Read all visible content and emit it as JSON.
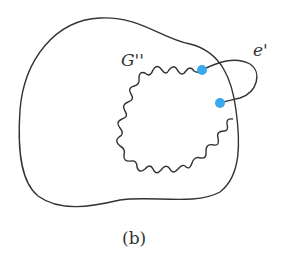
{
  "figure": {
    "caption": "(b)",
    "labels": {
      "subgraph": "G''",
      "edge": "e'"
    },
    "colors": {
      "stroke": "#333333",
      "vertex": "#3aa8ec",
      "background": "#ffffff"
    },
    "vertices": [
      {
        "id": "v1",
        "x": 202,
        "y": 70
      },
      {
        "id": "v2",
        "x": 220,
        "y": 103
      }
    ]
  }
}
